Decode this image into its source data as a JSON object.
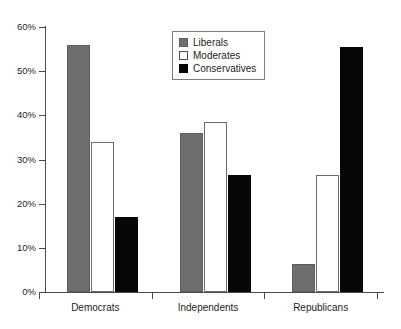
{
  "chart_data": {
    "type": "bar",
    "title": "",
    "subtitle": "",
    "xlabel": "",
    "ylabel": "",
    "categories": [
      "Democrats",
      "Independents",
      "Republicans"
    ],
    "series": [
      {
        "name": "Liberals",
        "color": "#6e6e6e",
        "values": [
          56,
          36,
          6.3
        ]
      },
      {
        "name": "Moderates",
        "color": "#ffffff",
        "values": [
          34,
          38.5,
          26.5
        ]
      },
      {
        "name": "Conservatives",
        "color": "#070707",
        "values": [
          17,
          26.5,
          55.5
        ]
      }
    ],
    "ylim": [
      0,
      60
    ],
    "ytick_values": [
      0,
      10,
      20,
      30,
      40,
      50,
      60
    ],
    "ytick_labels": [
      "0%",
      "10%",
      "20%",
      "30%",
      "40%",
      "50%",
      "60%"
    ],
    "grid": false,
    "legend_position": "top-center"
  },
  "legend": {
    "items": [
      {
        "label": "Liberals"
      },
      {
        "label": "Moderates"
      },
      {
        "label": "Conservatives"
      }
    ]
  }
}
